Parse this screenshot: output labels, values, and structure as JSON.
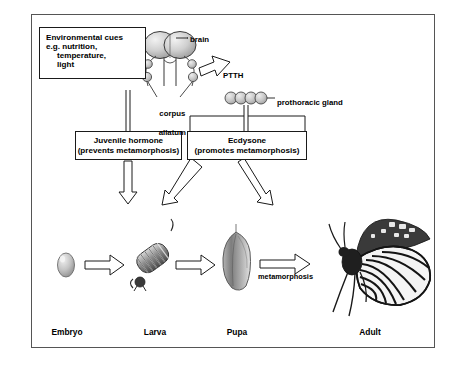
{
  "environmental_cues": {
    "line1": "Environmental cues",
    "line2": "e.g. nutrition,",
    "line3": "temperature,",
    "line4": "light"
  },
  "anatomy": {
    "brain": "brain",
    "corpus_allatum_line1": "corpus",
    "corpus_allatum_line2": "allatum",
    "prothoracic_gland": "prothoracic gland"
  },
  "signals": {
    "ptth": "PTTH"
  },
  "hormones": {
    "juvenile": {
      "name": "Juvenile hormone",
      "effect": "(prevents metamorphosis)"
    },
    "ecdysone": {
      "name": "Ecdysone",
      "effect": "(promotes metamorphosis)"
    }
  },
  "process": {
    "metamorphosis": "metamorphosis"
  },
  "life_stages": [
    {
      "label": "Embryo"
    },
    {
      "label": "Larva"
    },
    {
      "label": "Pupa"
    },
    {
      "label": "Adult"
    }
  ],
  "colors": {
    "frame": "#555555",
    "line": "#1a1a1a",
    "arrow_fill": "#ffffff",
    "organ_fill": "#c9c9c9",
    "text": "#000000"
  }
}
